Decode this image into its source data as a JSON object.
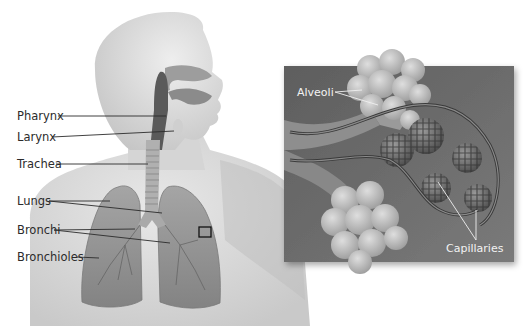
{
  "diagram": {
    "left_panel": {
      "labels": [
        {
          "id": "pharynx",
          "text": "Pharynx"
        },
        {
          "id": "larynx",
          "text": "Larynx"
        },
        {
          "id": "trachea",
          "text": "Trachea"
        },
        {
          "id": "lungs",
          "text": "Lungs"
        },
        {
          "id": "bronchi",
          "text": "Bronchi"
        },
        {
          "id": "bronchioles",
          "text": "Bronchioles"
        }
      ],
      "magnify_marker": "detail box on left lung"
    },
    "inset_panel": {
      "labels": [
        {
          "id": "alveoli",
          "text": "Alveoli"
        },
        {
          "id": "capillaries",
          "text": "Capillaries"
        }
      ]
    },
    "colors": {
      "background": "#ffffff",
      "body_silhouette": "#d9d9d9",
      "lung_fill": "#9a9a9a",
      "inset_background": "#6e6e6e",
      "alveoli_fill": "#bdbdbd",
      "leader_line": "#2b2b2b"
    }
  }
}
